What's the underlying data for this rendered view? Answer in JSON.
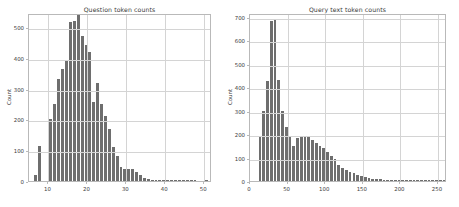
{
  "figure": {
    "width": 459,
    "height": 207,
    "background": "#ffffff",
    "bar_color": "#6e6e6e",
    "grid_color": "#d4d4d4",
    "axis_color": "#b9b9b9",
    "text_color": "#3a3a3a"
  },
  "panels": [
    {
      "id": "question-token-counts",
      "title": "Question token counts",
      "ylabel": "Count",
      "xticks": [
        "10",
        "20",
        "30",
        "40",
        "50"
      ],
      "yticks": [
        "0",
        "100",
        "200",
        "300",
        "400",
        "500"
      ]
    },
    {
      "id": "query-text-token-counts",
      "title": "Query text token counts",
      "ylabel": "Count",
      "xticks": [
        "0",
        "50",
        "100",
        "150",
        "200",
        "250"
      ],
      "yticks": [
        "0",
        "100",
        "200",
        "300",
        "400",
        "500",
        "600",
        "700"
      ]
    }
  ],
  "chart_data": [
    {
      "type": "bar",
      "title": "Question token counts",
      "xlabel": "",
      "ylabel": "Count",
      "xlim": [
        5,
        52
      ],
      "ylim": [
        0,
        545
      ],
      "xticks": [
        10,
        20,
        30,
        40,
        50
      ],
      "yticks": [
        0,
        100,
        200,
        300,
        400,
        500
      ],
      "grid": true,
      "legend": null,
      "bin_width": 1,
      "bin_starts": [
        6,
        7,
        8,
        9,
        10,
        11,
        12,
        13,
        14,
        15,
        16,
        17,
        18,
        19,
        20,
        21,
        22,
        23,
        24,
        25,
        26,
        27,
        28,
        29,
        30,
        31,
        32,
        33,
        34,
        35,
        36,
        37,
        38,
        39,
        40,
        41,
        42,
        43,
        44,
        45,
        46,
        47,
        48,
        49,
        50
      ],
      "values": [
        18,
        115,
        0,
        0,
        200,
        250,
        330,
        365,
        390,
        515,
        520,
        538,
        470,
        440,
        420,
        255,
        318,
        250,
        210,
        168,
        110,
        82,
        44,
        40,
        38,
        38,
        30,
        18,
        10,
        5,
        4,
        3,
        3,
        2,
        3,
        2,
        1,
        1,
        1,
        1,
        1,
        1,
        0,
        0,
        1
      ]
    },
    {
      "type": "bar",
      "title": "Query text token counts",
      "xlabel": "",
      "ylabel": "Count",
      "xlim": [
        0,
        262
      ],
      "ylim": [
        0,
        715
      ],
      "xticks": [
        0,
        50,
        100,
        150,
        200,
        250
      ],
      "yticks": [
        0,
        100,
        200,
        300,
        400,
        500,
        600,
        700
      ],
      "grid": true,
      "legend": null,
      "bin_width": 5,
      "bin_starts": [
        10,
        15,
        20,
        25,
        30,
        35,
        40,
        45,
        50,
        55,
        60,
        65,
        70,
        75,
        80,
        85,
        90,
        95,
        100,
        105,
        110,
        115,
        120,
        125,
        130,
        135,
        140,
        145,
        150,
        155,
        160,
        165,
        170,
        175,
        180,
        185,
        190,
        195,
        200,
        205,
        210,
        215,
        220,
        225,
        230,
        235,
        240,
        245,
        250,
        255
      ],
      "values": [
        190,
        300,
        425,
        680,
        690,
        430,
        300,
        230,
        190,
        150,
        185,
        192,
        190,
        190,
        175,
        160,
        150,
        140,
        125,
        105,
        95,
        70,
        55,
        45,
        40,
        32,
        25,
        20,
        16,
        12,
        10,
        8,
        7,
        6,
        5,
        5,
        4,
        4,
        3,
        3,
        2,
        2,
        2,
        2,
        1,
        1,
        1,
        1,
        1,
        1
      ]
    }
  ]
}
